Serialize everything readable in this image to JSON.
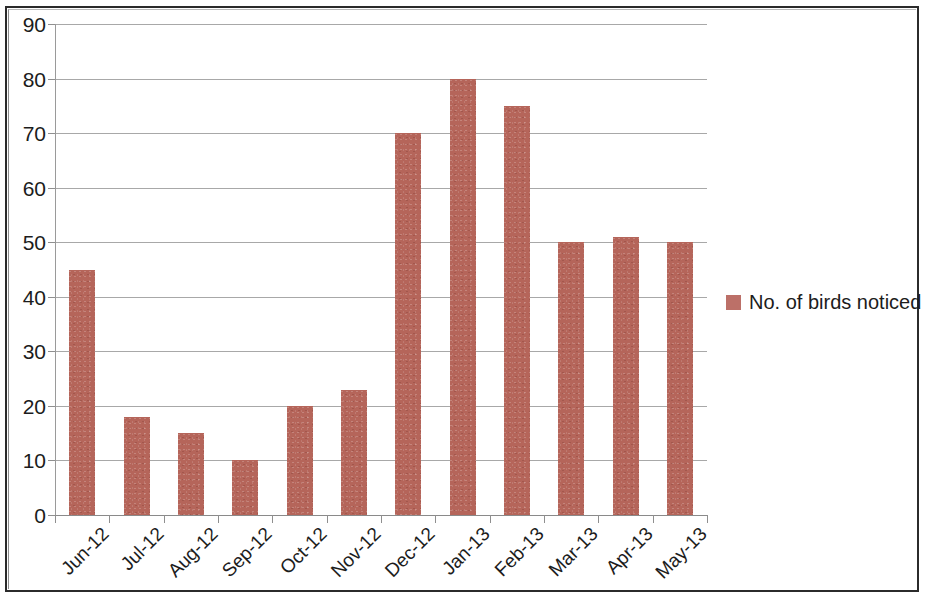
{
  "chart_data": {
    "type": "bar",
    "title": "",
    "subtitle": "",
    "xlabel": "",
    "ylabel": "",
    "ylim": [
      0,
      90
    ],
    "ytick_step": 10,
    "yticks": [
      0,
      10,
      20,
      30,
      40,
      50,
      60,
      70,
      80,
      90
    ],
    "grid": true,
    "legend_position": "right",
    "categories": [
      "Jun-12",
      "Jul-12",
      "Aug-12",
      "Sep-12",
      "Oct-12",
      "Nov-12",
      "Dec-12",
      "Jan-13",
      "Feb-13",
      "Mar-13",
      "Apr-13",
      "May-13"
    ],
    "series": [
      {
        "name": "No. of birds noticed",
        "color": "#b5655a",
        "values": [
          45,
          18,
          15,
          10,
          20,
          23,
          70,
          80,
          75,
          50,
          51,
          50
        ]
      }
    ]
  },
  "legend": {
    "items": [
      {
        "label": "No. of birds noticed",
        "color": "#bc7068"
      }
    ]
  },
  "colors": {
    "bar": "#b5655a",
    "legend_swatch": "#bc7068",
    "gridline": "#a8a8a8",
    "axis": "#9a9a9a",
    "text": "#1c1c1c",
    "frame": "#2b2b2b",
    "background": "#ffffff"
  }
}
